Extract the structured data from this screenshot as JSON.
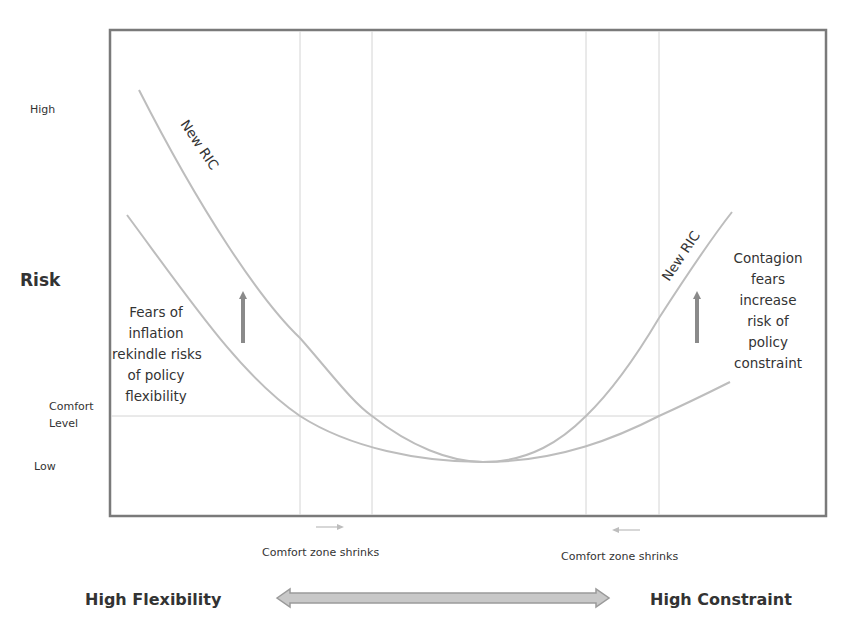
{
  "diagram": {
    "y_axis": {
      "title": "Risk",
      "labels": {
        "high": "High",
        "comfort_line1": "Comfort",
        "comfort_line2": "Level",
        "low": "Low"
      }
    },
    "x_axis": {
      "left_label": "High Flexibility",
      "right_label": "High Constraint"
    },
    "curves": [
      {
        "name": "Original RIC",
        "label": "",
        "color": "#bdbdbd"
      },
      {
        "name": "New RIC",
        "label": "New RIC",
        "color": "#bdbdbd"
      }
    ],
    "curve_labels": {
      "left": "New RIC",
      "right": "New RIC"
    },
    "annotations": {
      "left": [
        "Fears of",
        "inflation",
        "rekindle risks",
        "of policy",
        "flexibility"
      ],
      "right": [
        "Contagion",
        "fears",
        "increase",
        "risk of",
        "policy",
        "constraint"
      ],
      "comfort_left": "Comfort zone shrinks",
      "comfort_right": "Comfort zone shrinks"
    },
    "colors": {
      "frame": "#7a7a7a",
      "curve": "#bdbdbd",
      "gridline": "#d4d4d4",
      "shift_arrow": "#8a8a8a",
      "double_arrow_fill": "#c8c8c8",
      "double_arrow_stroke": "#9a9a9a"
    }
  }
}
